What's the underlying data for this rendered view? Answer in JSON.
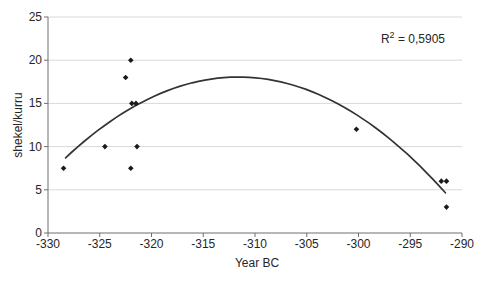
{
  "chart_data": {
    "type": "scatter",
    "title": "",
    "xlabel": "Year BC",
    "ylabel": "shekel/kurru",
    "xlim": [
      -330,
      -290
    ],
    "ylim": [
      0,
      25
    ],
    "x_ticks": [
      -330,
      -325,
      -320,
      -315,
      -310,
      -305,
      -300,
      -295,
      -290
    ],
    "y_ticks": [
      0,
      5,
      10,
      15,
      20,
      25
    ],
    "grid": "horizontal-only",
    "legend": "none",
    "points": [
      {
        "x": -328.5,
        "y": 7.5
      },
      {
        "x": -324.5,
        "y": 10
      },
      {
        "x": -322.5,
        "y": 18
      },
      {
        "x": -322,
        "y": 20
      },
      {
        "x": -321.9,
        "y": 15
      },
      {
        "x": -321.5,
        "y": 15
      },
      {
        "x": -321.4,
        "y": 10
      },
      {
        "x": -322,
        "y": 7.5
      },
      {
        "x": -300.2,
        "y": 12
      },
      {
        "x": -292,
        "y": 6
      },
      {
        "x": -291.5,
        "y": 6
      },
      {
        "x": -291.5,
        "y": 3
      }
    ],
    "trendline": {
      "kind": "polynomial",
      "order": 2,
      "vertex_x": -311.6,
      "vertex_y": 18.05,
      "a": -0.0335,
      "x_start": -328.3,
      "x_end": -291.6
    },
    "annotation": {
      "r_label": "R",
      "r_sup": "2",
      "r_rest": " = 0,5905"
    },
    "colors": {
      "marker": "#1a1a1a",
      "trendline": "#333333",
      "gridline": "#d9d9d9",
      "axis": "#6e6e6e",
      "text": "#262626"
    }
  }
}
